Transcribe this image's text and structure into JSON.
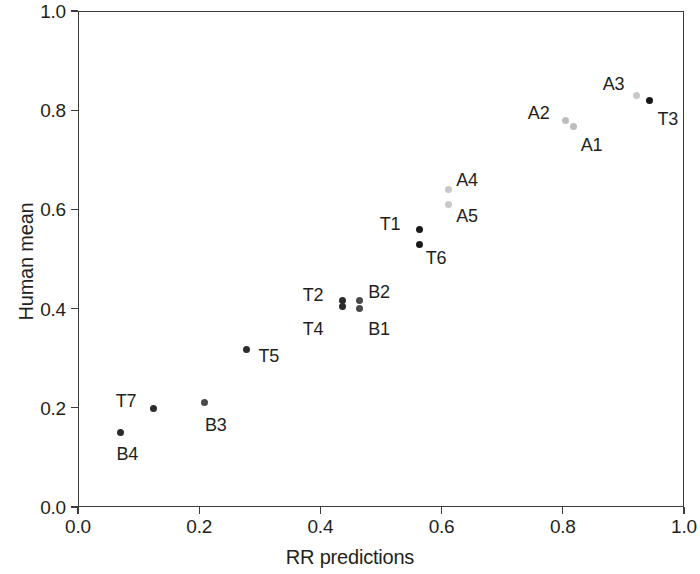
{
  "chart_data": {
    "type": "scatter",
    "title": "",
    "xlabel": "RR predictions",
    "ylabel": "Human mean",
    "xlim": [
      0.0,
      1.0
    ],
    "ylim": [
      0.0,
      1.0
    ],
    "xticks": [
      "0.0",
      "0.2",
      "0.4",
      "0.6",
      "0.8",
      "1.0"
    ],
    "yticks": [
      "0.0",
      "0.2",
      "0.4",
      "0.6",
      "0.8",
      "1.0"
    ],
    "xtick_values": [
      0.0,
      0.2,
      0.4,
      0.6,
      0.8,
      1.0
    ],
    "ytick_values": [
      0.0,
      0.2,
      0.4,
      0.6,
      0.8,
      1.0
    ],
    "grid": false,
    "legend": "none",
    "points": [
      {
        "label": "B4",
        "x": 0.07,
        "y": 0.151,
        "color": "#2b2b2b",
        "label_dx": -4,
        "label_dy": 22
      },
      {
        "label": "T7",
        "x": 0.125,
        "y": 0.199,
        "color": "#2b2b2b",
        "label_dx": -38,
        "label_dy": -7
      },
      {
        "label": "B3",
        "x": 0.208,
        "y": 0.21,
        "color": "#4a4a4a",
        "label_dx": 1,
        "label_dy": 22
      },
      {
        "label": "T5",
        "x": 0.278,
        "y": 0.317,
        "color": "#2b2b2b",
        "label_dx": 12,
        "label_dy": 6
      },
      {
        "label": "T2",
        "x": 0.437,
        "y": 0.417,
        "color": "#2b2b2b",
        "label_dx": -40,
        "label_dy": -5
      },
      {
        "label": "T4",
        "x": 0.437,
        "y": 0.405,
        "color": "#2b2b2b",
        "label_dx": -40,
        "label_dy": 23
      },
      {
        "label": "B2",
        "x": 0.464,
        "y": 0.417,
        "color": "#4a4a4a",
        "label_dx": 9,
        "label_dy": -8
      },
      {
        "label": "B1",
        "x": 0.464,
        "y": 0.401,
        "color": "#4a4a4a",
        "label_dx": 9,
        "label_dy": 21
      },
      {
        "label": "T1",
        "x": 0.564,
        "y": 0.559,
        "color": "#1a1a1a",
        "label_dx": -40,
        "label_dy": -6
      },
      {
        "label": "T6",
        "x": 0.564,
        "y": 0.53,
        "color": "#1a1a1a",
        "label_dx": 6,
        "label_dy": 14
      },
      {
        "label": "A4",
        "x": 0.611,
        "y": 0.64,
        "color": "#c9c9c9",
        "label_dx": 8,
        "label_dy": -10
      },
      {
        "label": "A5",
        "x": 0.611,
        "y": 0.609,
        "color": "#c9c9c9",
        "label_dx": 8,
        "label_dy": 11
      },
      {
        "label": "A2",
        "x": 0.805,
        "y": 0.78,
        "color": "#bdbdbd",
        "label_dx": -38,
        "label_dy": -7
      },
      {
        "label": "A1",
        "x": 0.818,
        "y": 0.768,
        "color": "#bdbdbd",
        "label_dx": 7,
        "label_dy": 19
      },
      {
        "label": "A3",
        "x": 0.922,
        "y": 0.83,
        "color": "#c9c9c9",
        "label_dx": -34,
        "label_dy": -11
      },
      {
        "label": "T3",
        "x": 0.943,
        "y": 0.819,
        "color": "#171717",
        "label_dx": 8,
        "label_dy": 18
      }
    ]
  },
  "axes": {
    "frame_color": "#3b3b3b"
  }
}
